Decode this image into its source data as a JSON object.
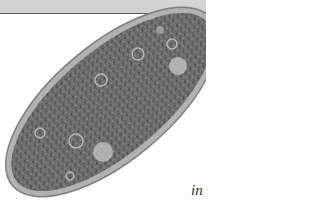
{
  "page": {
    "band_color": "#d3d3d3",
    "band_rule_color": "#5a5a5a"
  },
  "figure": {
    "membrane_color": "#a9a9a9",
    "cytoplasm_color": "#6e6e6e"
  },
  "caption": {
    "lines": [
      "P",
      "look",
      "mouth",
      "in tiny pr"
    ]
  }
}
